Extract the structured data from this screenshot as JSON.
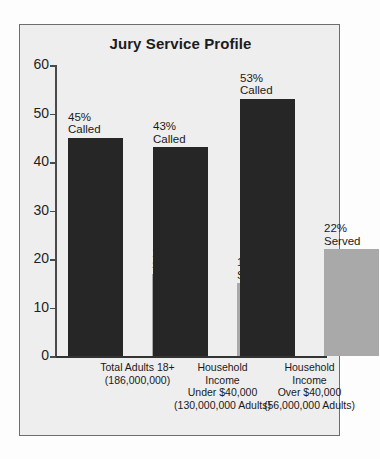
{
  "chart_data": {
    "type": "bar",
    "title": "Jury Service Profile",
    "xlabel": "",
    "ylabel": "",
    "ylim": [
      0,
      60
    ],
    "yticks": [
      0,
      10,
      20,
      30,
      40,
      50,
      60
    ],
    "grid": false,
    "legend": "none",
    "categories": [
      {
        "lines": [
          "Total Adults 18+",
          "(186,000,000)"
        ]
      },
      {
        "lines": [
          "Household",
          "Income",
          "Under $40,000",
          "(130,000,000 Adults)"
        ]
      },
      {
        "lines": [
          "Household",
          "Income",
          "Over $40,000",
          "(56,000,000 Adults)"
        ]
      }
    ],
    "series": [
      {
        "name": "Called",
        "color": "#262626",
        "values": [
          45,
          43,
          53
        ],
        "labels": [
          [
            "45%",
            "Called"
          ],
          [
            "43%",
            "Called"
          ],
          [
            "53%",
            "Called"
          ]
        ]
      },
      {
        "name": "Served",
        "color": "#a9a9a9",
        "values": [
          17,
          15,
          22
        ],
        "labels": [
          [
            "17%",
            "Served"
          ],
          [
            "15%",
            "Served"
          ],
          [
            "22%",
            "Served"
          ]
        ]
      }
    ]
  },
  "axis": {
    "tick_labels": [
      "0",
      "10",
      "20",
      "30",
      "40",
      "50",
      "60"
    ]
  }
}
